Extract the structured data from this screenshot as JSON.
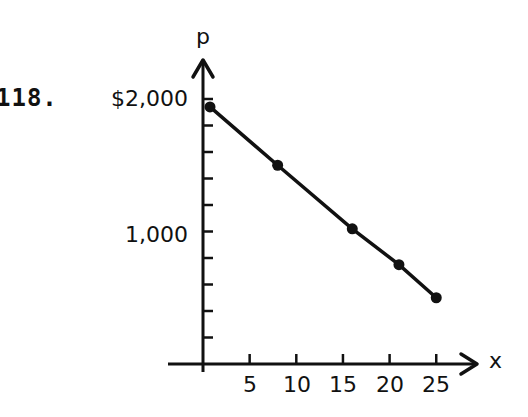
{
  "problem": {
    "number": "118."
  },
  "chart_data": {
    "type": "line",
    "title": "",
    "xlabel": "x",
    "ylabel": "p",
    "x": [
      0.75,
      8,
      16,
      21,
      25
    ],
    "values": [
      1940,
      1500,
      1020,
      750,
      500
    ],
    "series": [
      {
        "name": "p",
        "x": [
          0.75,
          8,
          16,
          21,
          25
        ],
        "values": [
          1940,
          1500,
          1020,
          750,
          500
        ],
        "markers": true
      }
    ],
    "xticks": [
      5,
      10,
      15,
      20,
      25
    ],
    "xtick_labels": [
      "5",
      "10",
      "15",
      "20",
      "25"
    ],
    "yticks": [
      200,
      400,
      600,
      800,
      1000,
      1200,
      1400,
      1600,
      1800,
      2000
    ],
    "ytick_labels_shown": {
      "1000": "1,000",
      "2000": "$2,000"
    },
    "xlim": [
      0,
      27
    ],
    "ylim": [
      0,
      2200
    ],
    "grid": false,
    "legend": null
  },
  "labels": {
    "y_top": "$2,000",
    "y_mid": "1,000",
    "y_axis": "p",
    "x_axis": "x",
    "x_ticks": [
      "5",
      "10",
      "15",
      "20",
      "25"
    ]
  }
}
